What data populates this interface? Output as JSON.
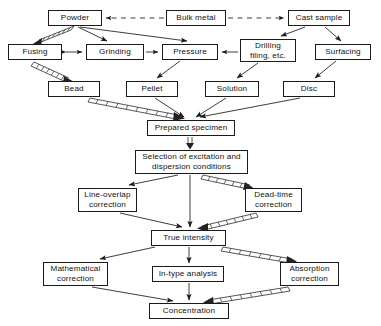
{
  "diagram": {
    "colors": {
      "stroke": "#1a1a1a",
      "box_fill": "#ffffff",
      "background": "#ffffff",
      "hatched_arrow": "#2b2b2b"
    },
    "nodes": [
      {
        "id": "powder",
        "label": "Powder",
        "x": 48,
        "y": 10,
        "w": 54,
        "h": 16,
        "lines": 1
      },
      {
        "id": "bulk-metal",
        "label": "Bulk metal",
        "x": 166,
        "y": 10,
        "w": 60,
        "h": 16,
        "lines": 1
      },
      {
        "id": "cast-sample",
        "label": "Cast sample",
        "x": 288,
        "y": 10,
        "w": 62,
        "h": 16,
        "lines": 1
      },
      {
        "id": "fusing",
        "label": "Fusing",
        "x": 8,
        "y": 44,
        "w": 54,
        "h": 16,
        "lines": 1
      },
      {
        "id": "grinding",
        "label": "Grinding",
        "x": 86,
        "y": 44,
        "w": 58,
        "h": 16,
        "lines": 1
      },
      {
        "id": "pressure",
        "label": "Pressure",
        "x": 162,
        "y": 44,
        "w": 56,
        "h": 16,
        "lines": 1
      },
      {
        "id": "drilling",
        "label": "Drilling\nfiling, etc.",
        "x": 240,
        "y": 39,
        "w": 56,
        "h": 23,
        "lines": 2
      },
      {
        "id": "surfacing",
        "label": "Surfacing",
        "x": 315,
        "y": 44,
        "w": 56,
        "h": 16,
        "lines": 1
      },
      {
        "id": "bead",
        "label": "Bead",
        "x": 48,
        "y": 81,
        "w": 52,
        "h": 16,
        "lines": 1
      },
      {
        "id": "pellet",
        "label": "Pellet",
        "x": 126,
        "y": 81,
        "w": 52,
        "h": 16,
        "lines": 1
      },
      {
        "id": "solution",
        "label": "Solution",
        "x": 205,
        "y": 81,
        "w": 54,
        "h": 16,
        "lines": 1
      },
      {
        "id": "disc",
        "label": "Disc",
        "x": 283,
        "y": 81,
        "w": 52,
        "h": 16,
        "lines": 1
      },
      {
        "id": "prepared",
        "label": "Prepared specimen",
        "x": 147,
        "y": 120,
        "w": 88,
        "h": 16,
        "lines": 1
      },
      {
        "id": "selection",
        "label": "Selection of excitation and\ndispersion conditions",
        "x": 135,
        "y": 150,
        "w": 113,
        "h": 24,
        "lines": 2
      },
      {
        "id": "line-overlap",
        "label": "Line-overlap\ncorrection",
        "x": 78,
        "y": 188,
        "w": 59,
        "h": 24,
        "lines": 2
      },
      {
        "id": "dead-time",
        "label": "Dead-time\ncorrection",
        "x": 245,
        "y": 188,
        "w": 57,
        "h": 24,
        "lines": 2
      },
      {
        "id": "true-intensity",
        "label": "True intensity",
        "x": 151,
        "y": 230,
        "w": 75,
        "h": 16,
        "lines": 1
      },
      {
        "id": "mathematical",
        "label": "Mathematical\ncorrection",
        "x": 43,
        "y": 262,
        "w": 65,
        "h": 24,
        "lines": 2
      },
      {
        "id": "in-type",
        "label": "In-type analysis",
        "x": 152,
        "y": 266,
        "w": 72,
        "h": 16,
        "lines": 1
      },
      {
        "id": "absorption",
        "label": "Absorption\ncorrection",
        "x": 280,
        "y": 262,
        "w": 59,
        "h": 24,
        "lines": 2
      },
      {
        "id": "concentration",
        "label": "Concentration",
        "x": 149,
        "y": 303,
        "w": 80,
        "h": 16,
        "lines": 1
      }
    ],
    "edges": [
      {
        "from": "bulk-metal",
        "to": "powder",
        "style": "dashed"
      },
      {
        "from": "bulk-metal",
        "to": "cast-sample",
        "style": "dashed"
      },
      {
        "from": "powder",
        "to": "fusing",
        "style": "hatched"
      },
      {
        "from": "powder",
        "to": "grinding",
        "style": "solid"
      },
      {
        "from": "powder",
        "to": "pressure",
        "style": "solid"
      },
      {
        "from": "fusing",
        "to": "grinding",
        "style": "solid-bidirectional"
      },
      {
        "from": "grinding",
        "to": "pressure",
        "style": "solid"
      },
      {
        "from": "drilling",
        "to": "pressure",
        "style": "solid"
      },
      {
        "from": "cast-sample",
        "to": "drilling",
        "style": "solid"
      },
      {
        "from": "cast-sample",
        "to": "surfacing",
        "style": "solid"
      },
      {
        "from": "fusing",
        "to": "bead",
        "style": "hatched"
      },
      {
        "from": "pressure",
        "to": "pellet",
        "style": "solid"
      },
      {
        "from": "drilling",
        "to": "solution",
        "style": "solid"
      },
      {
        "from": "surfacing",
        "to": "disc",
        "style": "solid"
      },
      {
        "from": "bead",
        "to": "prepared",
        "style": "hatched"
      },
      {
        "from": "pellet",
        "to": "prepared",
        "style": "solid"
      },
      {
        "from": "solution",
        "to": "prepared",
        "style": "solid"
      },
      {
        "from": "disc",
        "to": "prepared",
        "style": "solid"
      },
      {
        "from": "prepared",
        "to": "selection",
        "style": "hatched-vertical"
      },
      {
        "from": "selection",
        "to": "line-overlap",
        "style": "solid"
      },
      {
        "from": "selection",
        "to": "dead-time",
        "style": "hatched"
      },
      {
        "from": "selection",
        "to": "true-intensity",
        "style": "solid"
      },
      {
        "from": "line-overlap",
        "to": "true-intensity",
        "style": "solid"
      },
      {
        "from": "dead-time",
        "to": "true-intensity",
        "style": "hatched"
      },
      {
        "from": "true-intensity",
        "to": "mathematical",
        "style": "solid"
      },
      {
        "from": "true-intensity",
        "to": "in-type",
        "style": "solid"
      },
      {
        "from": "true-intensity",
        "to": "absorption",
        "style": "hatched"
      },
      {
        "from": "mathematical",
        "to": "concentration",
        "style": "solid"
      },
      {
        "from": "in-type",
        "to": "concentration",
        "style": "solid"
      },
      {
        "from": "absorption",
        "to": "concentration",
        "style": "hatched"
      }
    ]
  }
}
